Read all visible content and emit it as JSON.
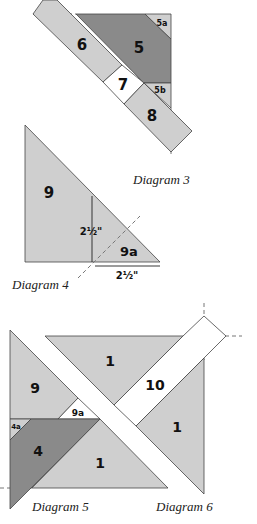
{
  "colors": {
    "light": "#cfcfcf",
    "dark": "#8a8a8a",
    "white": "#ffffff",
    "stroke": "#444444",
    "dash": "#777777"
  },
  "diagram3": {
    "caption": "Diagram 3",
    "labels": {
      "p6": "6",
      "p5": "5",
      "p5a": "5a",
      "p5b": "5b",
      "p7": "7",
      "p8": "8"
    }
  },
  "diagram4": {
    "caption": "Diagram 4",
    "labels": {
      "p9": "9",
      "p9a": "9a",
      "dim_v": "2½\"",
      "dim_h": "2½\""
    }
  },
  "diagram5": {
    "caption": "Diagram 5",
    "labels": {
      "p9": "9",
      "p9a": "9a",
      "p4": "4",
      "p4a": "4a",
      "p1": "1"
    }
  },
  "diagram6": {
    "caption": "Diagram 6",
    "labels": {
      "p1_top": "1",
      "p10": "10",
      "p1_right": "1"
    }
  }
}
